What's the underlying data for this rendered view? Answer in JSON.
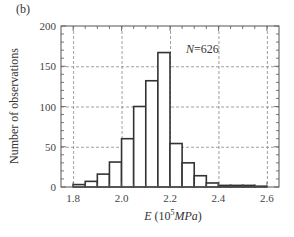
{
  "panel": {
    "label": "(b)"
  },
  "annotation": {
    "n_symbol": "N",
    "n_eq": "=626",
    "text": "N=626"
  },
  "axes": {
    "xlabel_var": "E",
    "xlabel_unit_prefix": " (10",
    "xlabel_exp": "5",
    "xlabel_unit": "MPa",
    "xlabel_close": ")",
    "xlabel_full": "E (10^5 MPa)",
    "ylabel": "Number of observations"
  },
  "chart_data": {
    "type": "bar",
    "subtype": "histogram",
    "title": "",
    "panel_label": "(b)",
    "xlabel": "E (10^5 MPa)",
    "ylabel": "Number of observations",
    "annotation": "N=626",
    "xlim": [
      1.75,
      2.65
    ],
    "ylim": [
      0,
      200
    ],
    "xticks": [
      1.8,
      2.0,
      2.2,
      2.4,
      2.6
    ],
    "xtick_labels": [
      "1.8",
      "2.0",
      "2.2",
      "2.4",
      "2.6"
    ],
    "yticks": [
      0,
      50,
      100,
      150,
      200
    ],
    "ytick_labels": [
      "0",
      "50",
      "100",
      "150",
      "200"
    ],
    "grid": true,
    "grid_style": "dashed",
    "bin_width": 0.05,
    "bin_edges": [
      1.8,
      1.85,
      1.9,
      1.95,
      2.0,
      2.05,
      2.1,
      2.15,
      2.2,
      2.25,
      2.3,
      2.35,
      2.4,
      2.45,
      2.5,
      2.55,
      2.6
    ],
    "categories": [
      "1.80-1.85",
      "1.85-1.90",
      "1.90-1.95",
      "1.95-2.00",
      "2.00-2.05",
      "2.05-2.10",
      "2.10-2.15",
      "2.15-2.20",
      "2.20-2.25",
      "2.25-2.30",
      "2.30-2.35",
      "2.35-2.40",
      "2.40-2.45",
      "2.45-2.50",
      "2.50-2.55",
      "2.55-2.60"
    ],
    "values": [
      3,
      7,
      16,
      31,
      60,
      100,
      132,
      167,
      54,
      30,
      14,
      5,
      2,
      2,
      2,
      1
    ],
    "legend": null,
    "colors": {
      "bar_fill": "#ffffff",
      "bar_edge": "#333333",
      "grid": "#888888",
      "axis": "#555555"
    }
  }
}
